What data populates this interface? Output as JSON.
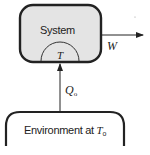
{
  "diagram": {
    "system": {
      "label": "System",
      "fill": "#e4e4e4",
      "stroke": "#222222"
    },
    "reservoir_region": {
      "label": "T"
    },
    "work": {
      "label": "W",
      "direction": "out of system, rightward"
    },
    "heat": {
      "label": "Q",
      "subscript": "o",
      "direction": "from environment into system, upward"
    },
    "environment": {
      "label_prefix": "Environment at ",
      "temp_label": "T",
      "temp_subscript": "o"
    }
  }
}
